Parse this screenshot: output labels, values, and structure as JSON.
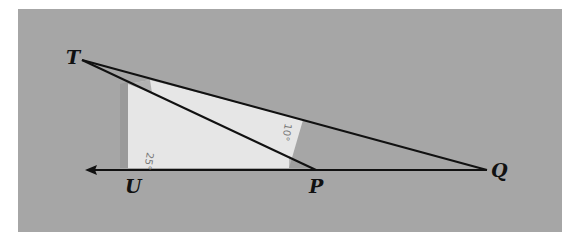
{
  "figure": {
    "type": "geometry-diagram",
    "colors": {
      "background": "#ffffff",
      "board": "#a6a6a6",
      "paper": "#e6e6e6",
      "paper_shadow": "#8f8f8f",
      "lines": "#111111",
      "angle_text": "#777777"
    },
    "points": {
      "T": {
        "label": "T",
        "x": 82,
        "y": 60
      },
      "U": {
        "label": "U",
        "x": 130,
        "y": 170
      },
      "P": {
        "label": "P",
        "x": 316,
        "y": 170
      },
      "Q": {
        "label": "Q",
        "x": 487,
        "y": 170
      }
    },
    "angles": [
      {
        "id": "angle-at-u-region",
        "label": "25°"
      },
      {
        "id": "angle-at-paper-right",
        "label": "10°"
      }
    ],
    "ray": {
      "from": "Q",
      "direction": "left",
      "arrow_end_x": 86
    }
  }
}
